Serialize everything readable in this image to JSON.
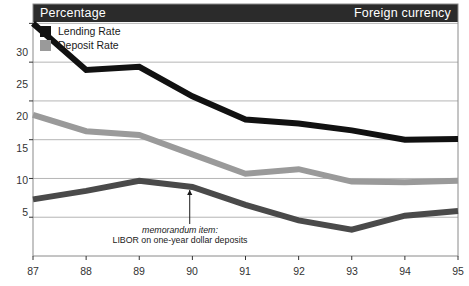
{
  "header": {
    "left_title": "Percentage",
    "right_title": "Foreign currency",
    "background_color": "#2b2b2b",
    "text_color": "#ffffff"
  },
  "legend": {
    "position": "top-left-inside",
    "items": [
      {
        "label": "Lending Rate",
        "color": "#111111",
        "swatch": "filled-square"
      },
      {
        "label": "Deposit Rate",
        "color": "#9a9a9a",
        "swatch": "filled-square"
      }
    ]
  },
  "annotation": {
    "line1": "memorandum item:",
    "line2": "LIBOR on one-year dollar deposits",
    "style": "italic-first-line-with-arrow",
    "arrow": "up-arrow-pointing-to-libor-line"
  },
  "chart_data": {
    "type": "line",
    "title": "Percentage",
    "subtitle": "Foreign currency",
    "xlabel": "",
    "ylabel": "Percentage",
    "x": [
      87,
      88,
      89,
      90,
      91,
      92,
      93,
      94,
      95
    ],
    "xtick_labels": [
      "87",
      "88",
      "89",
      "90",
      "91",
      "92",
      "93",
      "94",
      "95"
    ],
    "ytick_labels": [
      "5",
      "10",
      "15",
      "20",
      "25",
      "30"
    ],
    "yticks": [
      5,
      10,
      15,
      20,
      25,
      30
    ],
    "ylim": [
      0,
      32.5
    ],
    "xlim": [
      87,
      95
    ],
    "grid": "horizontal-only",
    "legend_position": "top-left",
    "series": [
      {
        "name": "Lending Rate",
        "color": "#111111",
        "linewidth": 6,
        "values": [
          30.0,
          24.0,
          24.4,
          20.6,
          17.6,
          17.1,
          16.2,
          15.0,
          15.1
        ]
      },
      {
        "name": "Deposit Rate",
        "color": "#9a9a9a",
        "linewidth": 6,
        "values": [
          18.2,
          16.1,
          15.6,
          13.1,
          10.6,
          11.2,
          9.6,
          9.5,
          9.7
        ]
      },
      {
        "name": "LIBOR on one-year dollar deposits",
        "color": "#4a4a4a",
        "linewidth": 6,
        "values": [
          7.3,
          8.4,
          9.7,
          8.9,
          6.6,
          4.6,
          3.4,
          5.2,
          5.8
        ]
      }
    ]
  },
  "axes": {
    "frame_color": "#8a8a8a",
    "grid_color": "#b5b5b5",
    "tick_color": "#333333"
  }
}
